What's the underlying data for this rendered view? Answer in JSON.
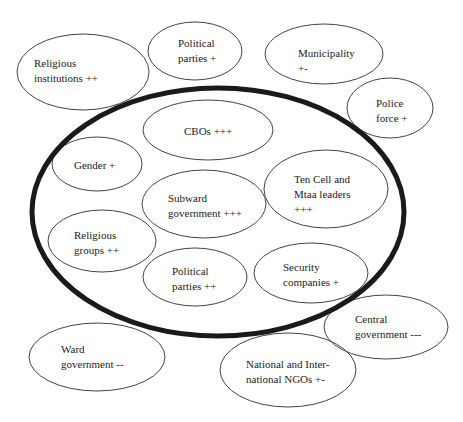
{
  "diagram": {
    "type": "venn-stakeholder-map",
    "boundary": {
      "name": "inner-community-circle",
      "cx": 218,
      "cy": 212,
      "rx": 186,
      "ry": 124,
      "stroke": "#1a1a1a",
      "stroke_width": 5
    },
    "nodes": [
      {
        "id": "religious-institutions",
        "label": "Religious\ninstitutions ++",
        "cx": 83,
        "cy": 72,
        "rx": 66,
        "ry": 38,
        "tx": 34,
        "ty": 56,
        "inside": false
      },
      {
        "id": "political-parties-outer",
        "label": "Political\nparties +",
        "cx": 195,
        "cy": 51,
        "rx": 47,
        "ry": 29,
        "tx": 178,
        "ty": 36,
        "inside": false
      },
      {
        "id": "municipality",
        "label": "Municipality\n+-",
        "cx": 324,
        "cy": 54,
        "rx": 59,
        "ry": 30,
        "tx": 298,
        "ty": 46,
        "inside": false
      },
      {
        "id": "police-force",
        "label": "Police\nforce +",
        "cx": 390,
        "cy": 108,
        "rx": 43,
        "ry": 30,
        "tx": 376,
        "ty": 96,
        "inside": false
      },
      {
        "id": "cbos",
        "label": "CBOs +++",
        "cx": 208,
        "cy": 130,
        "rx": 65,
        "ry": 30,
        "tx": 184,
        "ty": 124,
        "inside": true
      },
      {
        "id": "gender",
        "label": "Gender +",
        "cx": 97,
        "cy": 164,
        "rx": 45,
        "ry": 27,
        "tx": 74,
        "ty": 158,
        "inside": true
      },
      {
        "id": "subward-government",
        "label": "Subward\ngovernment +++",
        "cx": 204,
        "cy": 204,
        "rx": 62,
        "ry": 34,
        "tx": 168,
        "ty": 191,
        "inside": true
      },
      {
        "id": "ten-cell-mtaa-leaders",
        "label": "Ten Cell and\nMtaa leaders\n+++",
        "cx": 326,
        "cy": 189,
        "rx": 62,
        "ry": 39,
        "tx": 294,
        "ty": 172,
        "inside": true
      },
      {
        "id": "religious-groups",
        "label": "Religious\ngroups ++",
        "cx": 102,
        "cy": 241,
        "rx": 54,
        "ry": 31,
        "tx": 74,
        "ty": 228,
        "inside": true
      },
      {
        "id": "political-parties-inner",
        "label": "Political\nparties ++",
        "cx": 195,
        "cy": 277,
        "rx": 52,
        "ry": 29,
        "tx": 172,
        "ty": 264,
        "inside": true
      },
      {
        "id": "security-companies",
        "label": "Security\ncompanies +",
        "cx": 311,
        "cy": 273,
        "rx": 57,
        "ry": 30,
        "tx": 283,
        "ty": 260,
        "inside": true
      },
      {
        "id": "central-government",
        "label": "Central\ngovernment ---",
        "cx": 386,
        "cy": 327,
        "rx": 62,
        "ry": 32,
        "tx": 355,
        "ty": 312,
        "inside": false
      },
      {
        "id": "ward-government",
        "label": "Ward\ngovernment --",
        "cx": 97,
        "cy": 357,
        "rx": 68,
        "ry": 34,
        "tx": 61,
        "ty": 342,
        "inside": false
      },
      {
        "id": "national-international-ngos",
        "label": "National and Inter-\nnational NGOs +-",
        "cx": 288,
        "cy": 370,
        "rx": 68,
        "ry": 37,
        "tx": 246,
        "ty": 357,
        "inside": false
      }
    ],
    "colors": {
      "node_stroke": "#444444",
      "text": "#222222",
      "background": "#ffffff"
    }
  }
}
